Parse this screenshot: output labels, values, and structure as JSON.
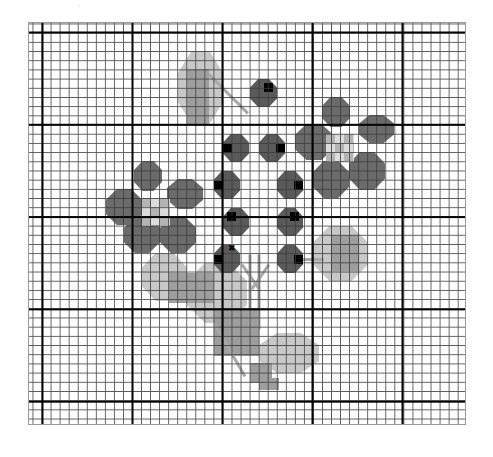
{
  "pattern": {
    "type": "cross-stitch chart",
    "grid": {
      "cell_px": 9,
      "major_every": 10
    },
    "colors": {
      "dark_petal": "#6b6b6b",
      "berry": "#5a5a5a",
      "berry_dot": "#000000",
      "leaf_mid": "#9e9e9e",
      "leaf_light": "#c8c8c8",
      "flower_center_light": "#dcdcdc",
      "flower_center_mid": "#b4b4b4",
      "stem": "#a8a8a8"
    },
    "center_mark": "✖",
    "top_mark": "·"
  },
  "shapes": {
    "berries": [
      {
        "x": 221,
        "y": 56,
        "w": 27,
        "h": 28,
        "dot": "tr"
      },
      {
        "x": 194,
        "y": 111,
        "w": 26,
        "h": 28,
        "dot": "l"
      },
      {
        "x": 230,
        "y": 111,
        "w": 26,
        "h": 28,
        "dot": "r"
      },
      {
        "x": 185,
        "y": 148,
        "w": 26,
        "h": 28,
        "dot": "l"
      },
      {
        "x": 248,
        "y": 148,
        "w": 26,
        "h": 28,
        "dot": "r"
      },
      {
        "x": 194,
        "y": 185,
        "w": 26,
        "h": 28,
        "dot": "tl"
      },
      {
        "x": 248,
        "y": 185,
        "w": 26,
        "h": 28,
        "dot": "tr"
      },
      {
        "x": 185,
        "y": 222,
        "w": 26,
        "h": 28,
        "dot": "l"
      },
      {
        "x": 248,
        "y": 222,
        "w": 26,
        "h": 28,
        "dot": "r"
      }
    ],
    "petals": [
      {
        "x": 293,
        "y": 74,
        "w": 28,
        "h": 30
      },
      {
        "x": 330,
        "y": 92,
        "w": 35,
        "h": 28
      },
      {
        "x": 266,
        "y": 101,
        "w": 38,
        "h": 36
      },
      {
        "x": 320,
        "y": 129,
        "w": 36,
        "h": 38
      },
      {
        "x": 284,
        "y": 138,
        "w": 36,
        "h": 37
      },
      {
        "x": 105,
        "y": 138,
        "w": 28,
        "h": 30
      },
      {
        "x": 138,
        "y": 156,
        "w": 36,
        "h": 30
      },
      {
        "x": 77,
        "y": 166,
        "w": 36,
        "h": 36
      },
      {
        "x": 95,
        "y": 194,
        "w": 36,
        "h": 36
      },
      {
        "x": 131,
        "y": 194,
        "w": 36,
        "h": 36
      }
    ],
    "flower_centers": [
      {
        "x": 297,
        "y": 111,
        "w": 28,
        "h": 28
      },
      {
        "x": 113,
        "y": 175,
        "w": 28,
        "h": 28
      }
    ],
    "leaves_light": [
      {
        "x": 149,
        "y": 28,
        "w": 45,
        "h": 73
      },
      {
        "x": 284,
        "y": 203,
        "w": 55,
        "h": 55
      },
      {
        "x": 113,
        "y": 230,
        "w": 45,
        "h": 48
      },
      {
        "x": 158,
        "y": 240,
        "w": 60,
        "h": 60
      },
      {
        "x": 230,
        "y": 310,
        "w": 60,
        "h": 40
      }
    ],
    "leaves_mid": [
      {
        "x": 158,
        "y": 46,
        "w": 22,
        "h": 55
      },
      {
        "x": 302,
        "y": 212,
        "w": 28,
        "h": 36
      },
      {
        "x": 140,
        "y": 250,
        "w": 45,
        "h": 30
      },
      {
        "x": 185,
        "y": 285,
        "w": 45,
        "h": 48
      },
      {
        "x": 221,
        "y": 340,
        "w": 22,
        "h": 20
      },
      {
        "x": 230,
        "y": 355,
        "w": 20,
        "h": 12
      }
    ],
    "stems": [
      {
        "x": 180,
        "y": 50,
        "len": 55,
        "angle": 45
      },
      {
        "x": 221,
        "y": 230,
        "len": 75,
        "angle": 90
      },
      {
        "x": 230,
        "y": 230,
        "len": 75,
        "angle": 90
      },
      {
        "x": 213,
        "y": 240,
        "len": 30,
        "angle": 55
      },
      {
        "x": 240,
        "y": 240,
        "len": 30,
        "angle": 125
      },
      {
        "x": 186,
        "y": 300,
        "len": 60,
        "angle": 60
      },
      {
        "x": 265,
        "y": 235,
        "len": 30,
        "angle": 0
      }
    ],
    "center_mark_pos": {
      "x": 199,
      "y": 221
    }
  }
}
